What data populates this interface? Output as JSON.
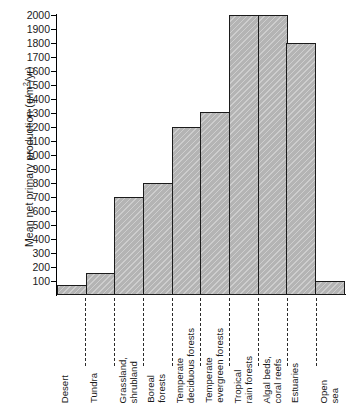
{
  "chart_data": {
    "type": "bar",
    "title": "",
    "xlabel": "",
    "ylabel": "Mean net primary production (g/m2/yr)",
    "ylabel_parts": {
      "pre": "Mean net primary production (g/m",
      "sup": "2",
      "post": "/yr)"
    },
    "ylim": [
      0,
      2000
    ],
    "grid": false,
    "legend": null,
    "ytick_labels": [
      "2000",
      "1900",
      "1800",
      "1700",
      "1600",
      "1500",
      "1400",
      "1300",
      "1200",
      "1100",
      "1000",
      "900",
      "800",
      "700",
      "600",
      "500",
      "400",
      "300",
      "200",
      "100"
    ],
    "ytick_values": [
      2000,
      1900,
      1800,
      1700,
      1600,
      1500,
      1400,
      1300,
      1200,
      1100,
      1000,
      900,
      800,
      700,
      600,
      500,
      400,
      300,
      200,
      100
    ],
    "categories": [
      "Desert",
      "Tundra",
      "Grassland,\nshrubland",
      "Boreal\nforests",
      "Temperate\ndeciduous forests",
      "Temperate\nevergreen forests",
      "Tropical\nrain forests",
      "Algal beds,\ncoral reefs",
      "Estuaries",
      "Open\nsea"
    ],
    "values": [
      70,
      160,
      700,
      800,
      1200,
      1310,
      2000,
      2000,
      1800,
      100
    ],
    "bar_fill_color": "#b4b4b4",
    "bar_edge_color": "#1b1b1b",
    "background_color": "#ffffff"
  }
}
